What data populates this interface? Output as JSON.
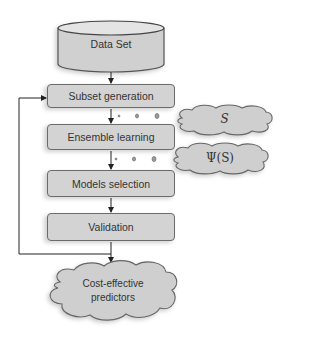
{
  "diagram": {
    "source": {
      "label": "Data Set",
      "shape": "cylinder"
    },
    "steps": [
      {
        "label": "Subset generation"
      },
      {
        "label": "Ensemble learning"
      },
      {
        "label": "Models selection"
      },
      {
        "label": "Validation"
      }
    ],
    "annotations": [
      {
        "label": "S",
        "attached_to": "Subset generation → Ensemble learning",
        "shape": "cloud"
      },
      {
        "label": "Ψ(S)",
        "attached_to": "Ensemble learning → Models selection",
        "shape": "cloud"
      }
    ],
    "output": {
      "label_line1": "Cost-effective",
      "label_line2": "predictors",
      "shape": "cloud"
    },
    "feedback_loop": {
      "from": "Validation",
      "to": "Subset generation"
    },
    "colors": {
      "fill": "#d3d3d3",
      "stroke": "#6b6b6b",
      "line": "#222222"
    }
  }
}
